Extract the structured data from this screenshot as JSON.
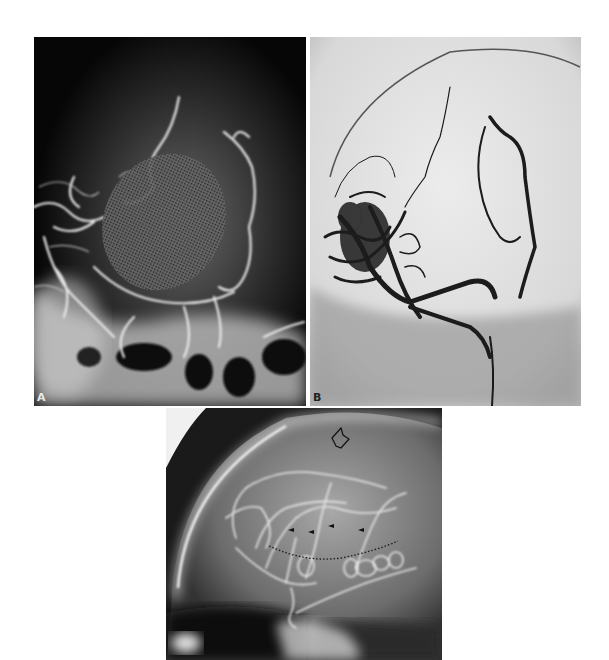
{
  "figure": {
    "panels": [
      {
        "id": "A",
        "label": "A",
        "description": "Lateral angiogram, dark background with bright vessels; stippled oval overlay region",
        "background_color": "#080808",
        "vessel_color": "#e0e0e0"
      },
      {
        "id": "B",
        "label": "B",
        "description": "Frontal subtraction angiogram, light background with dark vessels",
        "background_color": "#e6e6e6",
        "vessel_color": "#1a1a1a"
      },
      {
        "id": "C",
        "label": "",
        "description": "Lateral angiogram with open arrow, four small arrowheads and dotted curve",
        "background_color": "#1a1a1a",
        "vessel_color": "#d8d8d8",
        "annotations": {
          "open_arrow": 1,
          "arrowheads": 4,
          "dotted_line": 1
        }
      }
    ]
  }
}
